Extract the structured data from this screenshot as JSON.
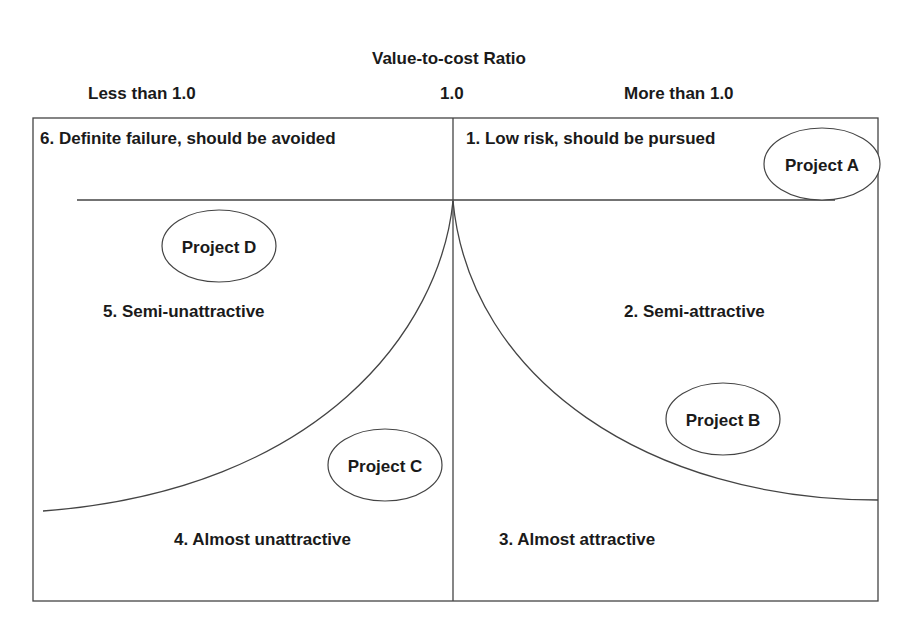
{
  "title": "Value-to-cost Ratio",
  "axis_labels": {
    "left": "Less than 1.0",
    "center": "1.0",
    "right": "More than 1.0"
  },
  "regions": [
    {
      "id": 1,
      "label": "1. Low risk, should be pursued"
    },
    {
      "id": 2,
      "label": "2. Semi-attractive"
    },
    {
      "id": 3,
      "label": "3. Almost attractive"
    },
    {
      "id": 4,
      "label": "4. Almost unattractive"
    },
    {
      "id": 5,
      "label": "5. Semi-unattractive"
    },
    {
      "id": 6,
      "label": "6. Definite failure, should be avoided"
    }
  ],
  "projects": [
    {
      "label": "Project A",
      "region": 1
    },
    {
      "label": "Project B",
      "region": 2
    },
    {
      "label": "Project C",
      "region": 4
    },
    {
      "label": "Project D",
      "region": 5
    }
  ],
  "colors": {
    "line": "#444444",
    "text": "#1a1a1a",
    "background": "#ffffff"
  }
}
